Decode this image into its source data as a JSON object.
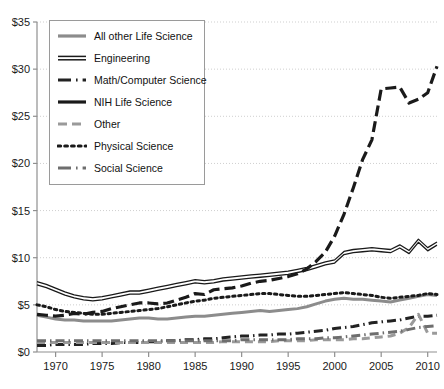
{
  "chart_data": {
    "type": "line",
    "title": "",
    "xlabel": "",
    "ylabel": "",
    "xlim": [
      1968,
      2011
    ],
    "ylim": [
      0,
      35
    ],
    "grid": true,
    "grid_axis": "y",
    "legend_position": "top-left",
    "y_tick_labels": [
      "$0",
      "$5",
      "$10",
      "$15",
      "$20",
      "$25",
      "$30",
      "$35"
    ],
    "y_ticks": [
      0,
      5,
      10,
      15,
      20,
      25,
      30,
      35
    ],
    "x_tick_labels": [
      "1970",
      "1975",
      "1980",
      "1985",
      "1990",
      "1995",
      "2000",
      "2005",
      "2010"
    ],
    "x_ticks": [
      1970,
      1975,
      1980,
      1985,
      1990,
      1995,
      2000,
      2005,
      2010
    ],
    "x": [
      1968,
      1969,
      1970,
      1971,
      1972,
      1973,
      1974,
      1975,
      1976,
      1977,
      1978,
      1979,
      1980,
      1981,
      1982,
      1983,
      1984,
      1985,
      1986,
      1987,
      1988,
      1989,
      1990,
      1991,
      1992,
      1993,
      1994,
      1995,
      1996,
      1997,
      1998,
      1999,
      2000,
      2001,
      2002,
      2003,
      2004,
      2005,
      2006,
      2007,
      2008,
      2009,
      2010,
      2011
    ],
    "series": [
      {
        "name": "All other Life Science",
        "style": "solid-gray",
        "color": "#8c8c8c",
        "values": [
          3.9,
          3.7,
          3.5,
          3.4,
          3.4,
          3.3,
          3.3,
          3.3,
          3.3,
          3.4,
          3.5,
          3.6,
          3.6,
          3.5,
          3.5,
          3.6,
          3.7,
          3.8,
          3.8,
          3.9,
          4.0,
          4.1,
          4.2,
          4.3,
          4.4,
          4.3,
          4.4,
          4.5,
          4.6,
          4.8,
          5.1,
          5.4,
          5.6,
          5.7,
          5.6,
          5.6,
          5.5,
          5.4,
          5.3,
          5.5,
          5.7,
          5.9,
          6.1,
          6.0
        ]
      },
      {
        "name": "Engineering",
        "style": "double-solid",
        "color": "#1a1a1a",
        "values": [
          7.3,
          7.0,
          6.6,
          6.2,
          5.9,
          5.7,
          5.6,
          5.7,
          5.9,
          6.1,
          6.3,
          6.3,
          6.5,
          6.7,
          6.9,
          7.1,
          7.3,
          7.5,
          7.4,
          7.5,
          7.7,
          7.8,
          7.9,
          8.0,
          8.1,
          8.2,
          8.3,
          8.4,
          8.6,
          8.8,
          9.1,
          9.4,
          9.6,
          10.5,
          10.7,
          10.8,
          10.9,
          10.8,
          10.7,
          11.2,
          10.6,
          11.8,
          10.9,
          11.5
        ]
      },
      {
        "name": "Math/Computer Science",
        "style": "dash-dot-dark",
        "color": "#222222",
        "values": [
          0.7,
          0.7,
          0.8,
          0.8,
          0.8,
          0.8,
          0.9,
          0.9,
          0.9,
          1.0,
          1.0,
          1.0,
          1.1,
          1.1,
          1.2,
          1.2,
          1.3,
          1.3,
          1.4,
          1.4,
          1.5,
          1.6,
          1.7,
          1.7,
          1.8,
          1.8,
          1.9,
          1.9,
          2.0,
          2.1,
          2.2,
          2.3,
          2.5,
          2.6,
          2.7,
          2.9,
          3.1,
          3.2,
          3.3,
          3.4,
          3.6,
          3.8,
          3.8,
          3.9
        ]
      },
      {
        "name": "NIH Life Science",
        "style": "long-dash-dark",
        "color": "#1a1a1a",
        "values": [
          4.0,
          3.9,
          3.8,
          3.9,
          4.1,
          4.0,
          4.2,
          4.3,
          4.6,
          4.8,
          5.0,
          5.2,
          5.2,
          5.1,
          5.2,
          5.5,
          5.8,
          6.2,
          6.1,
          6.6,
          6.7,
          6.8,
          7.0,
          7.3,
          7.5,
          7.6,
          7.8,
          8.0,
          8.3,
          8.8,
          9.6,
          10.6,
          12.3,
          14.6,
          17.4,
          20.4,
          22.5,
          27.9,
          28.0,
          28.1,
          26.4,
          26.8,
          27.5,
          30.3
        ]
      },
      {
        "name": "Other",
        "style": "dashed-gray",
        "color": "#9a9a9a",
        "values": [
          1.0,
          1.0,
          1.0,
          1.0,
          1.0,
          1.0,
          1.0,
          1.0,
          1.0,
          1.0,
          1.0,
          1.0,
          1.0,
          1.0,
          1.0,
          1.0,
          1.0,
          1.0,
          1.0,
          1.0,
          1.1,
          1.1,
          1.1,
          1.1,
          1.1,
          1.1,
          1.2,
          1.2,
          1.2,
          1.2,
          1.3,
          1.3,
          1.3,
          1.3,
          1.4,
          1.4,
          1.5,
          1.6,
          1.7,
          2.0,
          2.6,
          4.0,
          2.0,
          2.0
        ]
      },
      {
        "name": "Physical Science",
        "style": "dotted-dark",
        "color": "#1a1a1a",
        "values": [
          5.0,
          4.8,
          4.5,
          4.3,
          4.2,
          4.1,
          4.0,
          4.0,
          4.1,
          4.2,
          4.3,
          4.4,
          4.5,
          4.6,
          4.8,
          5.0,
          5.2,
          5.4,
          5.5,
          5.7,
          5.8,
          5.9,
          6.0,
          6.1,
          6.2,
          6.2,
          6.1,
          6.0,
          5.9,
          5.9,
          6.0,
          6.1,
          6.2,
          6.3,
          6.2,
          6.1,
          6.0,
          5.8,
          5.7,
          5.8,
          5.9,
          6.0,
          6.2,
          6.1
        ]
      },
      {
        "name": "Social Science",
        "style": "dash-dot-gray",
        "color": "#6e6e6e",
        "values": [
          1.2,
          1.2,
          1.2,
          1.2,
          1.2,
          1.2,
          1.2,
          1.2,
          1.2,
          1.2,
          1.2,
          1.2,
          1.2,
          1.2,
          1.2,
          1.2,
          1.2,
          1.2,
          1.2,
          1.2,
          1.2,
          1.2,
          1.3,
          1.3,
          1.3,
          1.3,
          1.3,
          1.3,
          1.4,
          1.4,
          1.4,
          1.5,
          1.5,
          1.6,
          1.7,
          1.8,
          1.9,
          2.0,
          2.1,
          2.2,
          2.4,
          2.6,
          2.7,
          2.8
        ]
      }
    ]
  },
  "legend": {
    "items": [
      {
        "label": "All other Life Science"
      },
      {
        "label": "Engineering"
      },
      {
        "label": "Math/Computer Science"
      },
      {
        "label": "NIH Life Science"
      },
      {
        "label": "Other"
      },
      {
        "label": "Physical Science"
      },
      {
        "label": "Social Science"
      }
    ]
  }
}
